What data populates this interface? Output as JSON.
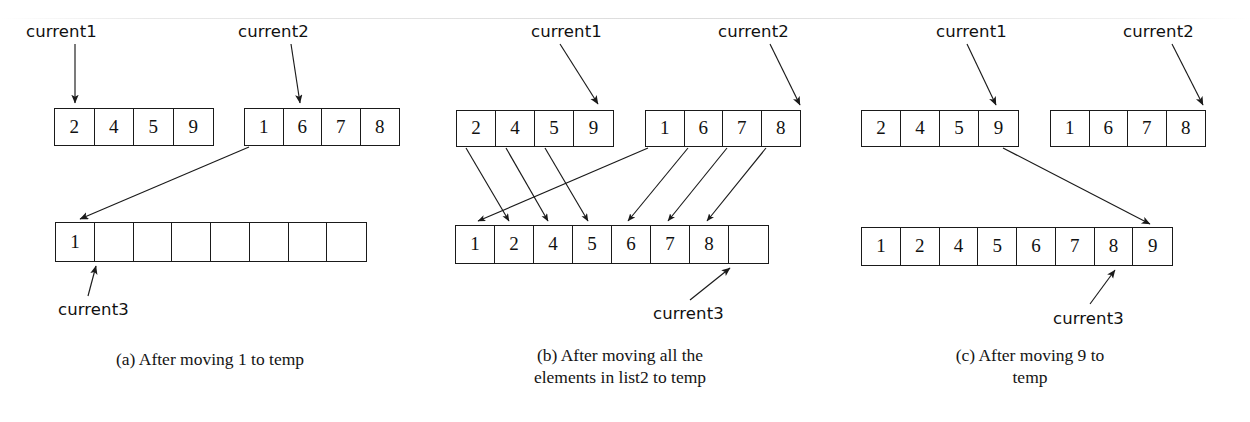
{
  "figure": {
    "title_absent": true,
    "background": "#ffffff",
    "ink_color": "#1a1a1a"
  },
  "labels": {
    "current1": "current1",
    "current2": "current2",
    "current3": "current3"
  },
  "panels": [
    {
      "id": "a",
      "caption": "(a) After moving 1 to temp",
      "list1": {
        "name": "list1",
        "values": [
          "2",
          "4",
          "5",
          "9"
        ]
      },
      "list2": {
        "name": "list2",
        "values": [
          "1",
          "6",
          "7",
          "8"
        ]
      },
      "temp": {
        "name": "temp",
        "values": [
          "1",
          "",
          "",
          "",
          "",
          "",
          "",
          ""
        ]
      },
      "pointers": {
        "current1": {
          "label": "current1",
          "target_index": 0,
          "target_array": "list1"
        },
        "current2": {
          "label": "current2",
          "target_index": 1,
          "target_array": "list2"
        },
        "current3": {
          "label": "current3",
          "target_index": 1,
          "target_array": "temp"
        }
      },
      "moves": [
        {
          "from": "list2[0]",
          "to": "temp[0]",
          "value": "1"
        }
      ]
    },
    {
      "id": "b",
      "caption": "(b) After moving all the\nelements in list2 to temp",
      "list1": {
        "name": "list1",
        "values": [
          "2",
          "4",
          "5",
          "9"
        ]
      },
      "list2": {
        "name": "list2",
        "values": [
          "1",
          "6",
          "7",
          "8"
        ]
      },
      "temp": {
        "name": "temp",
        "values": [
          "1",
          "2",
          "4",
          "5",
          "6",
          "7",
          "8",
          ""
        ]
      },
      "pointers": {
        "current1": {
          "label": "current1",
          "target_index": 3,
          "target_array": "list1"
        },
        "current2": {
          "label": "current2",
          "target_index": 4,
          "target_array": "list2"
        },
        "current3": {
          "label": "current3",
          "target_index": 7,
          "target_array": "temp"
        }
      },
      "moves": [
        {
          "from": "list1[0]",
          "to": "temp[1]",
          "value": "2"
        },
        {
          "from": "list1[1]",
          "to": "temp[2]",
          "value": "4"
        },
        {
          "from": "list1[2]",
          "to": "temp[3]",
          "value": "5"
        },
        {
          "from": "list2[0]",
          "to": "temp[0]",
          "value": "1"
        },
        {
          "from": "list2[1]",
          "to": "temp[4]",
          "value": "6"
        },
        {
          "from": "list2[2]",
          "to": "temp[5]",
          "value": "7"
        },
        {
          "from": "list2[3]",
          "to": "temp[6]",
          "value": "8"
        }
      ]
    },
    {
      "id": "c",
      "caption": "(c) After moving 9 to\ntemp",
      "list1": {
        "name": "list1",
        "values": [
          "2",
          "4",
          "5",
          "9"
        ]
      },
      "list2": {
        "name": "list2",
        "values": [
          "1",
          "6",
          "7",
          "8"
        ]
      },
      "temp": {
        "name": "temp",
        "values": [
          "1",
          "2",
          "4",
          "5",
          "6",
          "7",
          "8",
          "9"
        ]
      },
      "pointers": {
        "current1": {
          "label": "current1",
          "target_index": 3,
          "target_array": "list1"
        },
        "current2": {
          "label": "current2",
          "target_index": 4,
          "target_array": "list2"
        },
        "current3": {
          "label": "current3",
          "target_index": 7,
          "target_array": "temp"
        }
      },
      "moves": [
        {
          "from": "list1[3]",
          "to": "temp[7]",
          "value": "9"
        }
      ]
    }
  ]
}
